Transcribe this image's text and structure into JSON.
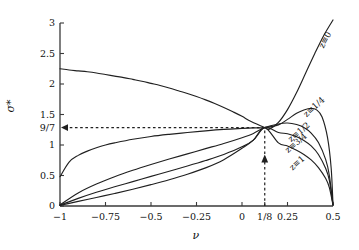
{
  "chart_data": {
    "type": "line",
    "title": "",
    "xlabel": "ν",
    "ylabel": "σ*",
    "xlim": [
      -1,
      0.5
    ],
    "ylim": [
      0,
      3
    ],
    "grid": false,
    "legend_position": "inline-right-of-curves",
    "xticks": [
      {
        "value": -1,
        "label": "−1"
      },
      {
        "value": -0.75,
        "label": "−0.75"
      },
      {
        "value": -0.5,
        "label": "−0.5"
      },
      {
        "value": -0.25,
        "label": "−0.25"
      },
      {
        "value": 0,
        "label": "0"
      },
      {
        "value": 0.125,
        "label": "1/8"
      },
      {
        "value": 0.25,
        "label": "0.25"
      },
      {
        "value": 0.5,
        "label": "0.5"
      }
    ],
    "yticks": [
      {
        "value": 0,
        "label": "0"
      },
      {
        "value": 0.5,
        "label": "0.5"
      },
      {
        "value": 1,
        "label": "1"
      },
      {
        "value": 1.2857,
        "label": "9/7"
      },
      {
        "value": 1.5,
        "label": "1.5"
      },
      {
        "value": 2,
        "label": "2"
      },
      {
        "value": 2.5,
        "label": "2.5"
      },
      {
        "value": 3,
        "label": "3"
      }
    ],
    "crossing_point": {
      "x": 0.125,
      "y": 1.2857,
      "x_label": "1/8",
      "y_label": "9/7"
    },
    "annotations": [
      {
        "name": "horizontal-guide",
        "kind": "dashed-arrow",
        "from": [
          0.125,
          1.2857
        ],
        "to": [
          -1,
          1.2857
        ],
        "label": "9/7"
      },
      {
        "name": "vertical-guide",
        "kind": "dashed-arrow",
        "from": [
          0.125,
          0
        ],
        "to": [
          0.125,
          1.2857
        ],
        "label": "1/8"
      }
    ],
    "series": [
      {
        "name": "z=0",
        "label": "z≡0",
        "label_pos": {
          "x": 0.455,
          "y": 2.72
        },
        "label_rotation": -62,
        "x": [
          -1,
          -0.95,
          -0.9,
          -0.85,
          -0.8,
          -0.75,
          -0.7,
          -0.65,
          -0.6,
          -0.55,
          -0.5,
          -0.45,
          -0.4,
          -0.35,
          -0.3,
          -0.25,
          -0.2,
          -0.15,
          -0.1,
          -0.05,
          0,
          0.05,
          0.125,
          0.15,
          0.2,
          0.25,
          0.3,
          0.35,
          0.4,
          0.45,
          0.5
        ],
        "y": [
          2.25,
          2.23,
          2.215,
          2.2,
          2.18,
          2.155,
          2.13,
          2.105,
          2.075,
          2.045,
          2.01,
          1.975,
          1.935,
          1.89,
          1.845,
          1.795,
          1.74,
          1.68,
          1.615,
          1.545,
          1.47,
          1.385,
          1.2857,
          1.26,
          1.37,
          1.58,
          1.86,
          2.18,
          2.5,
          2.8,
          3.05
        ]
      },
      {
        "name": "z=1/4",
        "label": "z≡1/4",
        "label_pos": {
          "x": 0.395,
          "y": 1.63
        },
        "label_rotation": -42,
        "x": [
          -1,
          -0.95,
          -0.9,
          -0.85,
          -0.8,
          -0.75,
          -0.7,
          -0.6,
          -0.5,
          -0.4,
          -0.3,
          -0.2,
          -0.1,
          0,
          0.0625,
          0.125,
          0.2,
          0.25,
          0.3,
          0.34,
          0.38,
          0.41,
          0.44,
          0.47,
          0.49,
          0.5
        ],
        "y": [
          0.48,
          0.72,
          0.83,
          0.9,
          0.955,
          1.0,
          1.035,
          1.095,
          1.14,
          1.175,
          1.205,
          1.232,
          1.255,
          1.272,
          1.281,
          1.2857,
          1.33,
          1.42,
          1.52,
          1.575,
          1.6,
          1.575,
          1.46,
          1.12,
          0.62,
          0.02
        ]
      },
      {
        "name": "z=1/2",
        "label": "z≡1/2",
        "label_pos": {
          "x": 0.315,
          "y": 1.21
        },
        "label_rotation": -40,
        "x": [
          -1,
          -0.9,
          -0.8,
          -0.7,
          -0.6,
          -0.5,
          -0.4,
          -0.3,
          -0.2,
          -0.1,
          0,
          0.0625,
          0.125,
          0.2,
          0.25,
          0.3,
          0.34,
          0.38,
          0.42,
          0.46,
          0.48,
          0.5
        ],
        "y": [
          0.02,
          0.215,
          0.36,
          0.48,
          0.585,
          0.68,
          0.77,
          0.855,
          0.94,
          1.025,
          1.12,
          1.19,
          1.2857,
          1.345,
          1.36,
          1.335,
          1.285,
          1.195,
          1.04,
          0.76,
          0.5,
          0.02
        ]
      },
      {
        "name": "z=3/4",
        "label": "z≡3/4",
        "label_pos": {
          "x": 0.295,
          "y": 1.03
        },
        "label_rotation": -40,
        "x": [
          -1,
          -0.9,
          -0.8,
          -0.7,
          -0.6,
          -0.5,
          -0.4,
          -0.3,
          -0.2,
          -0.1,
          0,
          0.0625,
          0.125,
          0.2,
          0.25,
          0.3,
          0.34,
          0.38,
          0.42,
          0.46,
          0.48,
          0.5
        ],
        "y": [
          0.015,
          0.125,
          0.225,
          0.315,
          0.4,
          0.485,
          0.57,
          0.655,
          0.745,
          0.845,
          0.97,
          1.08,
          1.2857,
          1.205,
          1.185,
          1.135,
          1.075,
          0.985,
          0.845,
          0.615,
          0.42,
          0.02
        ]
      },
      {
        "name": "z=1",
        "label": "z≡1",
        "label_pos": {
          "x": 0.3,
          "y": 0.7
        },
        "label_rotation": -42,
        "x": [
          -1,
          -0.9,
          -0.8,
          -0.7,
          -0.6,
          -0.5,
          -0.4,
          -0.3,
          -0.2,
          -0.1,
          0,
          0.0625,
          0.125,
          0.2,
          0.25,
          0.3,
          0.34,
          0.38,
          0.42,
          0.46,
          0.48,
          0.5
        ],
        "y": [
          0.01,
          0.075,
          0.14,
          0.205,
          0.275,
          0.35,
          0.43,
          0.52,
          0.625,
          0.76,
          0.945,
          1.08,
          1.2857,
          1.035,
          0.985,
          0.915,
          0.845,
          0.755,
          0.63,
          0.45,
          0.3,
          0.015
        ]
      }
    ],
    "style": {
      "line_color": "#202020",
      "axis_color": "#3a3a3a",
      "background": "#ffffff",
      "dash_color": "#202020"
    }
  }
}
